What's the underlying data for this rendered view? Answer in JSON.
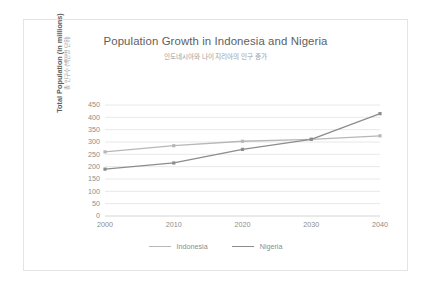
{
  "chart_data": {
    "type": "line",
    "title": "Population Growth in Indonesia and Nigeria",
    "subtitle": "인도네시아와 나이지리아의 인구 증가",
    "xlabel": "",
    "ylabel": "Total Population (in millions)",
    "ylabel_ko": "총 인구수 (백만명 단위)",
    "categories": [
      "2000",
      "2010",
      "2020",
      "2030",
      "2040"
    ],
    "x": [
      2000,
      2010,
      2020,
      2030,
      2040
    ],
    "ylim": [
      0,
      450
    ],
    "ytick_step": 50,
    "yticks": [
      "450",
      "400",
      "350",
      "300",
      "250",
      "200",
      "150",
      "100",
      "50",
      "0"
    ],
    "grid": true,
    "grid_axis": "y",
    "legend_position": "bottom",
    "markers": true,
    "series": [
      {
        "name": "Indonesia",
        "color": "#b7b7b7",
        "values": [
          260,
          285,
          303,
          311,
          325
        ]
      },
      {
        "name": "Nigeria",
        "color": "#8c8c8c",
        "values": [
          190,
          215,
          270,
          311,
          415
        ]
      }
    ]
  },
  "style": {
    "card_border": "#e4e4e4",
    "grid_color": "#e8e8e8",
    "axis_color": "#d4d4d4",
    "title_color": "#5e5e5e",
    "subtitle_color": "#9a9a9a",
    "tick_color": "#8d8d8d",
    "background": "#ffffff"
  }
}
